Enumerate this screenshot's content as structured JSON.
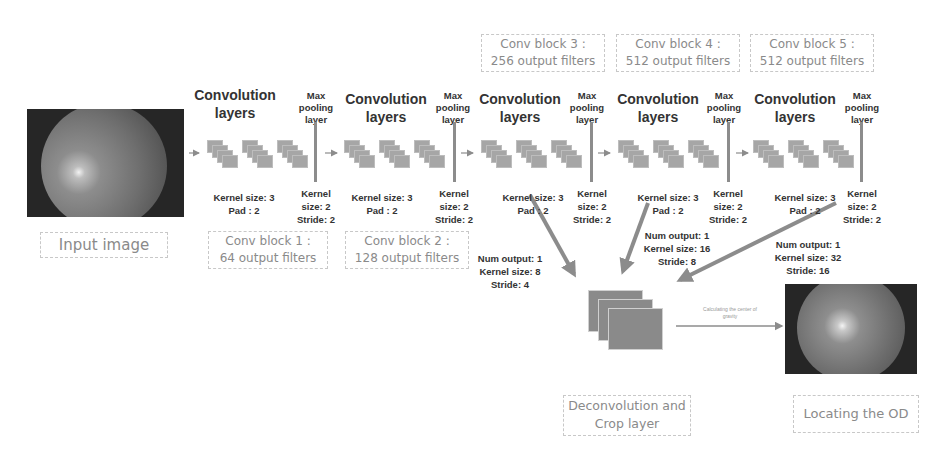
{
  "diagram": {
    "input": {
      "label": "Input image"
    },
    "blocks": [
      {
        "id": 1,
        "conv_title": "Convolution layers",
        "pool_title": "Max pooling layer",
        "conv_params": [
          "Kernel size: 3",
          "Pad : 2"
        ],
        "pool_params": [
          "Kernel",
          "size: 2",
          "Stride: 2"
        ],
        "block_label": [
          "Conv block 1 :",
          "64  output filters"
        ]
      },
      {
        "id": 2,
        "conv_title": "Convolution layers",
        "pool_title": "Max pooling layer",
        "conv_params": [
          "Kernel size: 3",
          "Pad : 2"
        ],
        "pool_params": [
          "Kernel",
          "size: 2",
          "Stride: 2"
        ],
        "block_label": [
          "Conv block 2 :",
          "128  output filters"
        ]
      },
      {
        "id": 3,
        "conv_title": "Convolution layers",
        "pool_title": "Max pooling layer",
        "conv_params": [
          "Kernel size: 3",
          "Pad : 2"
        ],
        "pool_params": [
          "Kernel",
          "size: 2",
          "Stride: 2"
        ],
        "block_label": [
          "Conv block 3 :",
          "256  output filters"
        ]
      },
      {
        "id": 4,
        "conv_title": "Convolution layers",
        "pool_title": "Max pooling layer",
        "conv_params": [
          "Kernel size: 3",
          "Pad : 2"
        ],
        "pool_params": [
          "Kernel",
          "size: 2",
          "Stride: 2"
        ],
        "block_label": [
          "Conv block 4 :",
          "512  output filters"
        ]
      },
      {
        "id": 5,
        "conv_title": "Convolution layers",
        "pool_title": "Max pooling layer",
        "conv_params": [
          "Kernel size: 3",
          "Pad : 2"
        ],
        "pool_params": [
          "Kernel",
          "size: 2",
          "Stride: 2"
        ],
        "block_label": [
          "Conv block 5 :",
          "512  output filters"
        ]
      }
    ],
    "deconv_branches": [
      {
        "from_block": 3,
        "params": [
          "Num output: 1",
          "Kernel size: 8",
          "Stride: 4"
        ]
      },
      {
        "from_block": 4,
        "params": [
          "Num output: 1",
          "Kernel size: 16",
          "Stride: 8"
        ]
      },
      {
        "from_block": 5,
        "params": [
          "Num output: 1",
          "Kernel size: 32",
          "Stride: 16"
        ]
      }
    ],
    "deconv": {
      "label_line1": "Deconvolution and",
      "label_line2": "Crop layer"
    },
    "gravity_caption": {
      "line1": "Calculating the center of",
      "line2": "gravity"
    },
    "output": {
      "label": "Locating the OD"
    },
    "colors": {
      "arrow": "#8c8c8c",
      "text": "#333333",
      "label_text": "#8a8a8a",
      "box_border": "#c8c8c8"
    }
  }
}
